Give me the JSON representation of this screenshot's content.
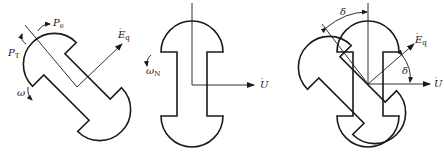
{
  "figures": [
    {
      "id": "rotor-generator",
      "labels": {
        "pe": "P",
        "pe_sub": "e",
        "pt": "P",
        "pt_sub": "T",
        "omega": "ω",
        "eq": "E",
        "eq_sub": "q"
      }
    },
    {
      "id": "rotor-synchronous",
      "labels": {
        "omega_n": "ω",
        "omega_n_sub": "N",
        "u": "U"
      }
    },
    {
      "id": "rotor-overlay",
      "labels": {
        "delta_top": "δ",
        "delta_right": "δ",
        "eq": "E",
        "eq_sub": "q",
        "u": "U"
      }
    }
  ],
  "colors": {
    "stroke": "#1a1a1a",
    "background": "#ffffff"
  }
}
